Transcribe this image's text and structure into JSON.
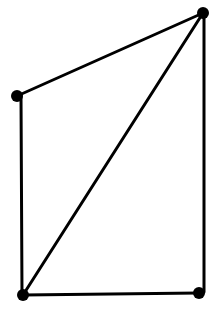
{
  "diagram": {
    "type": "graph",
    "background": "#ffffff",
    "stroke_color": "#000000",
    "stroke_width": 3,
    "node_radius": 6,
    "nodes": [
      {
        "id": "top-right",
        "x": 203,
        "y": 13
      },
      {
        "id": "left",
        "x": 17,
        "y": 96
      },
      {
        "id": "bottom-left",
        "x": 23,
        "y": 295
      },
      {
        "id": "bottom-right",
        "x": 199,
        "y": 293
      }
    ],
    "edges": [
      {
        "from": "top-right",
        "to": "left",
        "x1": 203,
        "y1": 13,
        "x2": 17,
        "y2": 96
      },
      {
        "from": "left",
        "to": "bottom-left",
        "x1": 21,
        "y1": 96,
        "x2": 22,
        "y2": 295
      },
      {
        "from": "bottom-left",
        "to": "bottom-right",
        "x1": 23,
        "y1": 295,
        "x2": 199,
        "y2": 293
      },
      {
        "from": "top-right",
        "to": "bottom-right",
        "x1": 204,
        "y1": 13,
        "x2": 204,
        "y2": 292
      },
      {
        "from": "bottom-left",
        "to": "top-right",
        "x1": 23,
        "y1": 295,
        "x2": 203,
        "y2": 13
      }
    ]
  }
}
